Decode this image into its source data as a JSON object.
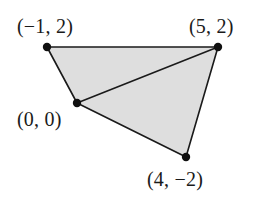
{
  "figure": {
    "kind": "coordinate-geometry-diagram",
    "width": 256,
    "height": 202,
    "background_color": "#ffffff",
    "fill_color": "#dedede",
    "stroke_color": "#1a1a1a",
    "stroke_width": 1.6,
    "dot_color": "#101010",
    "dot_radius": 4.2,
    "vertices": [
      {
        "id": "a",
        "label": "(−1, 2)",
        "math_x": -1,
        "math_y": 2,
        "px": 47,
        "py": 47
      },
      {
        "id": "b",
        "label": "(5, 2)",
        "math_x": 5,
        "math_y": 2,
        "px": 218,
        "py": 47
      },
      {
        "id": "d",
        "label": "(4, −2)",
        "math_x": 4,
        "math_y": -2,
        "px": 186,
        "py": 157
      },
      {
        "id": "c",
        "label": "(0, 0)",
        "math_x": 0,
        "math_y": 0,
        "px": 77,
        "py": 103
      }
    ],
    "outline_path": "M 47 47 L 218 47 L 186 157 L 77 103 Z",
    "diagonal": {
      "from": "c",
      "to": "b",
      "path": "M 77 103 L 218 47"
    },
    "regions": [
      {
        "name": "upper-triangle",
        "vertices": [
          "a",
          "b",
          "c"
        ]
      },
      {
        "name": "lower-triangle",
        "vertices": [
          "c",
          "b",
          "d"
        ]
      }
    ]
  },
  "labels": {
    "a": "(−1, 2)",
    "b": "(5, 2)",
    "c": "(0, 0)",
    "d": "(4, −2)"
  }
}
